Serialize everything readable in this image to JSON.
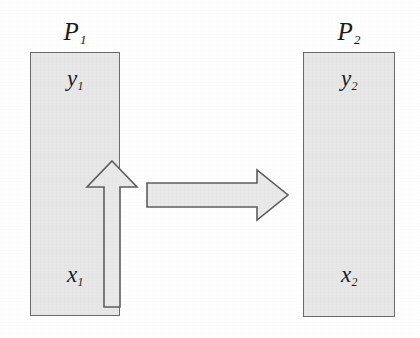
{
  "diagram": {
    "type": "transformation-diagram",
    "background_color": "#ffffff",
    "panel_fill_color": "#e7e7e7",
    "panel_border_color": "#6b6b6b",
    "arrow_fill_color": "#e9e9e9",
    "arrow_border_color": "#5d5d5d",
    "panels": [
      {
        "id": "left",
        "caption": "P",
        "caption_subscript": "1",
        "top_axis_label": "y",
        "top_axis_subscript": "1",
        "bottom_axis_label": "x",
        "bottom_axis_subscript": "1",
        "inner_arrow_direction": "up"
      },
      {
        "id": "right",
        "caption": "P",
        "caption_subscript": "2",
        "top_axis_label": "y",
        "top_axis_subscript": "2",
        "bottom_axis_label": "x",
        "bottom_axis_subscript": "2",
        "inner_arrow_direction": "up"
      }
    ],
    "transform_arrow": {
      "direction": "right",
      "label": ""
    }
  }
}
